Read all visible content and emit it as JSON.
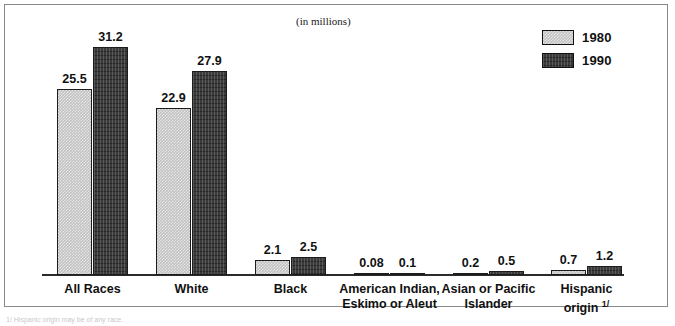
{
  "figure": {
    "units_caption": "(in millions)",
    "footnote": "1/ Hispanic origin may be of any race.",
    "frame_color": "#8a8a8a"
  },
  "legend": {
    "position": "top-right",
    "entries": [
      {
        "label": "1980",
        "swatch": "light-hatch-swatch",
        "color": "#c2c2c2"
      },
      {
        "label": "1990",
        "swatch": "dark-hatch-swatch",
        "color": "#3a3a3a"
      }
    ]
  },
  "chart_data": {
    "type": "bar",
    "title": "",
    "subtitle": "(in millions)",
    "xlabel": "",
    "ylabel": "",
    "ylim": [
      0,
      34
    ],
    "grid": false,
    "legend_position": "top-right",
    "categories": [
      "All Races",
      "White",
      "Black",
      "American Indian, Eskimo or Aleut",
      "Asian or Pacific Islander",
      "Hispanic origin 1/"
    ],
    "category_lines": [
      [
        "All Races"
      ],
      [
        "White"
      ],
      [
        "Black"
      ],
      [
        "American Indian,",
        "Eskimo or Aleut"
      ],
      [
        "Asian or Pacific",
        "Islander"
      ],
      [
        "Hispanic",
        "origin 1/"
      ]
    ],
    "series": [
      {
        "name": "1980",
        "values": [
          25.5,
          22.9,
          2.1,
          0.08,
          0.2,
          0.7
        ]
      },
      {
        "name": "1990",
        "values": [
          31.2,
          27.9,
          2.5,
          0.1,
          0.5,
          1.2
        ]
      }
    ],
    "value_labels": {
      "1980": [
        "25.5",
        "22.9",
        "2.1",
        "0.08",
        "0.2",
        "0.7"
      ],
      "1990": [
        "31.2",
        "27.9",
        "2.5",
        "0.1",
        "0.5",
        "1.2"
      ]
    }
  }
}
